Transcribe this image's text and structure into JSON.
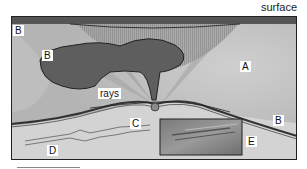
{
  "diagram": {
    "surface_label": "surface",
    "rays_label": "rays",
    "region_labels": {
      "b_top_left": "B",
      "b_body": "B",
      "a": "A",
      "c": "C",
      "b_right": "B",
      "d": "D",
      "e": "E"
    },
    "colors": {
      "surface_band": "#555555",
      "background": "#c8c8c8",
      "light_zone": "#d8d8d8",
      "dark_body": "#5a5a5a",
      "frame": "#222222"
    }
  }
}
